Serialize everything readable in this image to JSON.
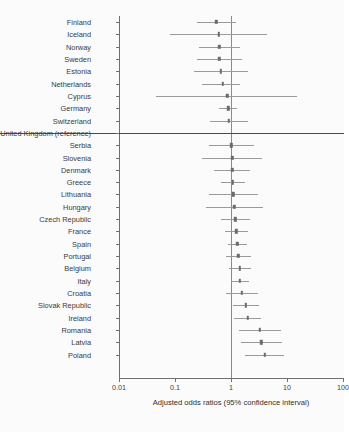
{
  "figure": {
    "background_color": "#fbfbfb",
    "line_color": "#9a9a9a",
    "point_color": "#6b6b6b",
    "axis_color": "#6f6f6f",
    "reference_line_color": "#8a8a8a"
  },
  "axis": {
    "xlabel": "Adjusted odds ratios (95% confidence interval)",
    "tick_labels": [
      "0.01",
      "0.1",
      "1",
      "100",
      "10"
    ],
    "ticks": [
      "0.01",
      "0.1",
      "1",
      "10",
      "100"
    ]
  },
  "chart_data": {
    "type": "scatter",
    "title": "",
    "xlabel": "Adjusted odds ratios (95% confidence interval)",
    "ylabel": "",
    "xscale": "log",
    "xlim": [
      0.01,
      100
    ],
    "xticks": [
      0.01,
      0.1,
      1,
      10,
      100
    ],
    "xtick_labels": [
      "0.01",
      "0.1",
      "1",
      "10",
      "100"
    ],
    "grid": false,
    "legend": false,
    "reference_line_x": 1,
    "categories": [
      "Finland",
      "Iceland",
      "Norway",
      "Sweden",
      "Estonia",
      "Netherlands",
      "Cyprus",
      "Germany",
      "Switzerland",
      "United Kingdom (reference)",
      "Serbia",
      "Slovenia",
      "Denmark",
      "Greece",
      "Lithuania",
      "Hungary",
      "Czech Republic",
      "France",
      "Spain",
      "Portugal",
      "Belgium",
      "Italy",
      "Croatia",
      "Slovak Republic",
      "Ireland",
      "Romania",
      "Latvia",
      "Poland"
    ],
    "series": [
      {
        "name": "Adjusted odds ratio",
        "points": [
          {
            "label": "Finland",
            "or": 0.55,
            "lo": 0.25,
            "hi": 1.22,
            "reference": false
          },
          {
            "label": "Iceland",
            "or": 0.6,
            "lo": 0.08,
            "hi": 4.4,
            "reference": false
          },
          {
            "label": "Norway",
            "or": 0.62,
            "lo": 0.27,
            "hi": 1.45,
            "reference": false
          },
          {
            "label": "Sweden",
            "or": 0.62,
            "lo": 0.25,
            "hi": 1.55,
            "reference": false
          },
          {
            "label": "Estonia",
            "or": 0.66,
            "lo": 0.22,
            "hi": 2.0,
            "reference": false
          },
          {
            "label": "Netherlands",
            "or": 0.72,
            "lo": 0.3,
            "hi": 1.45,
            "reference": false
          },
          {
            "label": "Cyprus",
            "or": 0.86,
            "lo": 0.045,
            "hi": 15.0,
            "reference": false
          },
          {
            "label": "Germany",
            "or": 0.9,
            "lo": 0.62,
            "hi": 1.3,
            "reference": false
          },
          {
            "label": "Switzerland",
            "or": 0.92,
            "lo": 0.42,
            "hi": 2.0,
            "reference": false
          },
          {
            "label": "United Kingdom (reference)",
            "or": 1.0,
            "lo": null,
            "hi": null,
            "reference": true
          },
          {
            "label": "Serbia",
            "or": 1.02,
            "lo": 0.4,
            "hi": 2.6,
            "reference": false
          },
          {
            "label": "Slovenia",
            "or": 1.05,
            "lo": 0.3,
            "hi": 3.6,
            "reference": false
          },
          {
            "label": "Denmark",
            "or": 1.05,
            "lo": 0.5,
            "hi": 2.2,
            "reference": false
          },
          {
            "label": "Greece",
            "or": 1.08,
            "lo": 0.66,
            "hi": 1.75,
            "reference": false
          },
          {
            "label": "Lithuania",
            "or": 1.1,
            "lo": 0.4,
            "hi": 3.0,
            "reference": false
          },
          {
            "label": "Hungary",
            "or": 1.15,
            "lo": 0.36,
            "hi": 3.7,
            "reference": false
          },
          {
            "label": "Czech Republic",
            "or": 1.2,
            "lo": 0.66,
            "hi": 2.2,
            "reference": false
          },
          {
            "label": "France",
            "or": 1.25,
            "lo": 0.78,
            "hi": 2.0,
            "reference": false
          },
          {
            "label": "Spain",
            "or": 1.3,
            "lo": 0.9,
            "hi": 1.9,
            "reference": false
          },
          {
            "label": "Portugal",
            "or": 1.35,
            "lo": 0.82,
            "hi": 2.25,
            "reference": false
          },
          {
            "label": "Belgium",
            "or": 1.45,
            "lo": 0.92,
            "hi": 2.3,
            "reference": false
          },
          {
            "label": "Italy",
            "or": 1.45,
            "lo": 1.0,
            "hi": 2.1,
            "reference": false
          },
          {
            "label": "Croatia",
            "or": 1.55,
            "lo": 0.8,
            "hi": 3.0,
            "reference": false
          },
          {
            "label": "Slovak Republic",
            "or": 1.85,
            "lo": 1.1,
            "hi": 3.1,
            "reference": false
          },
          {
            "label": "Ireland",
            "or": 2.0,
            "lo": 1.15,
            "hi": 3.5,
            "reference": false
          },
          {
            "label": "Romania",
            "or": 3.3,
            "lo": 1.4,
            "hi": 7.8,
            "reference": false
          },
          {
            "label": "Latvia",
            "or": 3.5,
            "lo": 1.5,
            "hi": 8.2,
            "reference": false
          },
          {
            "label": "Poland",
            "or": 4.0,
            "lo": 1.8,
            "hi": 9.0,
            "reference": false
          }
        ]
      }
    ]
  }
}
